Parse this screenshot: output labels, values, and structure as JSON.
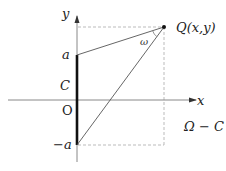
{
  "diagram": {
    "labels": {
      "y_axis": "y",
      "x_axis": "x",
      "point_q": "Q(x,y)",
      "a": "a",
      "neg_a": "−a",
      "c": "C",
      "origin": "O",
      "omega": "ω",
      "region": "Ω − C"
    },
    "colors": {
      "axis": "#888888",
      "segment": "#111111",
      "lines": "#555555",
      "dashed": "#bbbbbb"
    }
  }
}
